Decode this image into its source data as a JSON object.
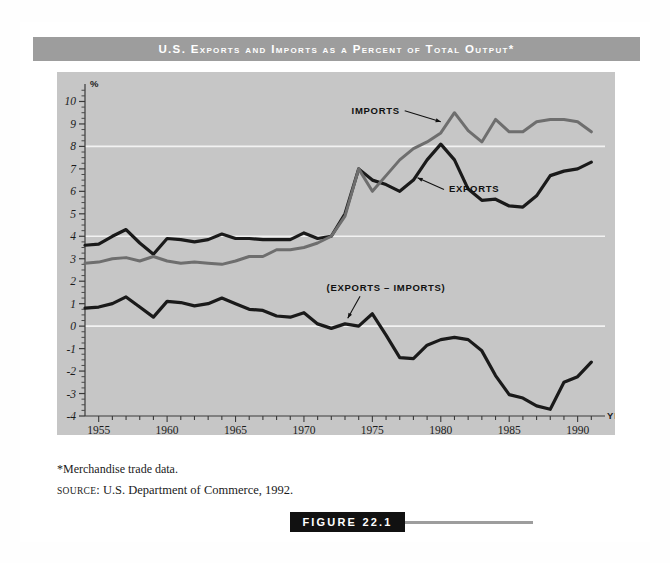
{
  "figure": {
    "title": "U.S. Exports and Imports as a Percent of Total Output*",
    "footnote": "*Merchandise trade data.",
    "source_prefix": "SOURCE",
    "source_text": ": U.S. Department of Commerce, 1992.",
    "tag": "FIGURE 22.1"
  },
  "colors": {
    "title_bar": "#9d9d9d",
    "plot_background": "#c6c6c6",
    "gridline": "#f2f2f2",
    "exports_line": "#1a1a1a",
    "imports_line": "#6e6e6e",
    "net_line": "#1a1a1a",
    "tag_background": "#111111"
  },
  "chart_data": {
    "type": "line",
    "title": "U.S. Exports and Imports as a Percent of Total Output*",
    "xlabel": "YEAR",
    "ylabel": "%",
    "xlim": [
      1954,
      1992
    ],
    "ylim": [
      -4,
      10.6
    ],
    "grid": true,
    "gridlines_y": [
      8,
      4,
      0
    ],
    "ytick_labels": [
      "10",
      "9",
      "8",
      "7",
      "6",
      "5",
      "4",
      "3",
      "2",
      "1",
      "0",
      "-1",
      "-2",
      "-3",
      "-4"
    ],
    "ytick_values": [
      10,
      9,
      8,
      7,
      6,
      5,
      4,
      3,
      2,
      1,
      0,
      -1,
      -2,
      -3,
      -4
    ],
    "xtick_labels": [
      "1955",
      "1960",
      "1965",
      "1970",
      "1975",
      "1980",
      "1985",
      "1990"
    ],
    "xtick_values": [
      1955,
      1960,
      1965,
      1970,
      1975,
      1980,
      1985,
      1990
    ],
    "xtick_minor_step": 1,
    "legend_position": "inline-annotations",
    "annotations": [
      {
        "text": "IMPORTS",
        "x": 1977.0,
        "y": 9.45,
        "target_x": 1980.0,
        "target_y": 9.1
      },
      {
        "text": "EXPORTS",
        "x": 1980.6,
        "y": 5.95,
        "target_x": 1978.3,
        "target_y": 6.6
      },
      {
        "text": "(EXPORTS – IMPORTS)",
        "x": 1976.0,
        "y": 1.55,
        "target_x": 1973.2,
        "target_y": 0.35
      }
    ],
    "x": [
      1954,
      1955,
      1956,
      1957,
      1958,
      1959,
      1960,
      1961,
      1962,
      1963,
      1964,
      1965,
      1966,
      1967,
      1968,
      1969,
      1970,
      1971,
      1972,
      1973,
      1974,
      1975,
      1976,
      1977,
      1978,
      1979,
      1980,
      1981,
      1982,
      1983,
      1984,
      1985,
      1986,
      1987,
      1988,
      1989,
      1990,
      1991
    ],
    "series": [
      {
        "name": "EXPORTS",
        "color": "#1a1a1a",
        "values": [
          3.6,
          3.65,
          4.0,
          4.3,
          3.7,
          3.2,
          3.9,
          3.85,
          3.75,
          3.85,
          4.1,
          3.9,
          3.9,
          3.85,
          3.85,
          3.85,
          4.15,
          3.9,
          4.0,
          5.0,
          7.0,
          6.5,
          6.3,
          6.0,
          6.5,
          7.4,
          8.1,
          7.4,
          6.1,
          5.6,
          5.65,
          5.35,
          5.3,
          5.8,
          6.7,
          6.9,
          7.0,
          7.3
        ]
      },
      {
        "name": "IMPORTS",
        "color": "#6e6e6e",
        "values": [
          2.8,
          2.85,
          3.0,
          3.05,
          2.9,
          3.1,
          2.9,
          2.8,
          2.85,
          2.8,
          2.75,
          2.9,
          3.1,
          3.1,
          3.4,
          3.4,
          3.5,
          3.7,
          4.0,
          4.9,
          7.0,
          6.0,
          6.7,
          7.4,
          7.9,
          8.2,
          8.6,
          9.5,
          8.7,
          8.2,
          9.2,
          8.65,
          8.65,
          9.1,
          9.2,
          9.2,
          9.1,
          8.65
        ]
      },
      {
        "name": "(EXPORTS – IMPORTS)",
        "color": "#1a1a1a",
        "values": [
          0.8,
          0.85,
          1.0,
          1.3,
          0.85,
          0.4,
          1.1,
          1.05,
          0.9,
          1.0,
          1.25,
          1.0,
          0.75,
          0.7,
          0.45,
          0.4,
          0.6,
          0.1,
          -0.1,
          0.1,
          0.0,
          0.55,
          -0.4,
          -1.4,
          -1.45,
          -0.85,
          -0.6,
          -0.5,
          -0.6,
          -1.1,
          -2.2,
          -3.05,
          -3.2,
          -3.55,
          -3.7,
          -2.5,
          -2.25,
          -1.6
        ]
      }
    ]
  }
}
